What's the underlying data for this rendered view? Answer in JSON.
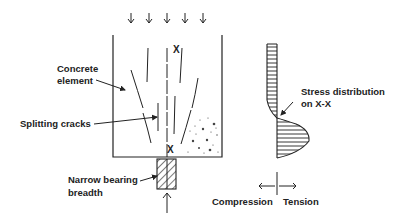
{
  "diagram": {
    "labels": {
      "concrete_element_line1": "Concrete",
      "concrete_element_line2": "element",
      "splitting_cracks": "Splitting cracks",
      "narrow_bearing_line1": "Narrow bearing",
      "narrow_bearing_line2": "breadth",
      "stress_line1": "Stress distribution",
      "stress_line2": "on X-X",
      "section_mark_top": "X",
      "section_mark_bottom": "X",
      "compression": "Compression",
      "tension": "Tension"
    },
    "colors": {
      "line": "#222222",
      "background": "#ffffff"
    },
    "applied_load_arrows": 5
  }
}
